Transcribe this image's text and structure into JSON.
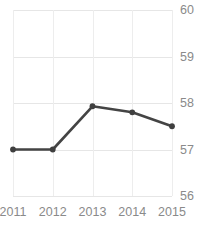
{
  "chart_data": {
    "type": "line",
    "title": "Freedom Trend",
    "xlabel": "",
    "ylabel": "",
    "categories": [
      "2011",
      "2012",
      "2013",
      "2014",
      "2015"
    ],
    "x": [
      2011,
      2012,
      2013,
      2014,
      2015
    ],
    "series": [
      {
        "name": "Freedom",
        "values": [
          57.0,
          57.0,
          57.93,
          57.8,
          57.5
        ]
      }
    ],
    "values": [
      57.0,
      57.0,
      57.93,
      57.8,
      57.5
    ],
    "ylim": [
      56,
      60
    ],
    "xlim": [
      2011,
      2015
    ],
    "y_ticks": [
      "56",
      "57",
      "58",
      "59",
      "60"
    ],
    "y_tick_values": [
      56,
      57,
      58,
      59,
      60
    ],
    "x_ticks": [
      "2011",
      "2012",
      "2013",
      "2014",
      "2015"
    ],
    "grid": true,
    "legend": false,
    "legend_position": "none",
    "y_axis_side": "right",
    "marker": "circle",
    "colors": {
      "line": "#444444",
      "marker": "#3f3f3f",
      "grid": "#e6e6e6",
      "tick_label": "#8a8a8a",
      "title": "#3c3c3c",
      "background": "#ffffff"
    }
  }
}
